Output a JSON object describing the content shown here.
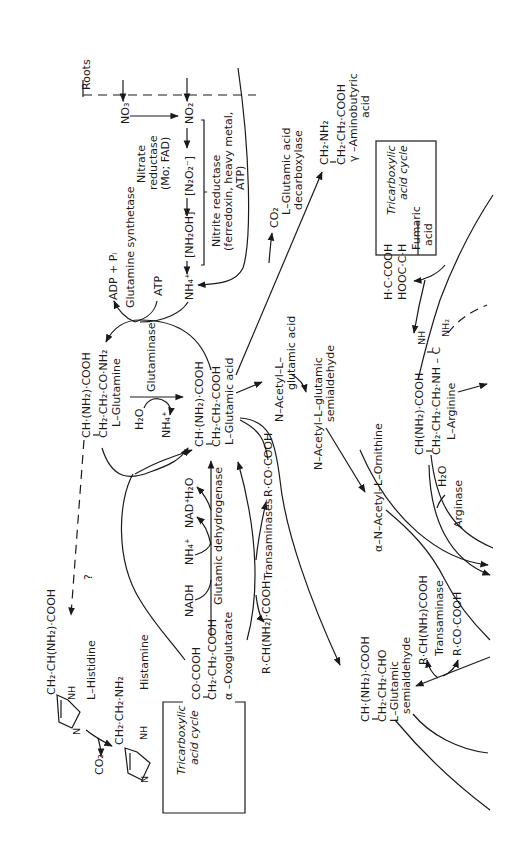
{
  "figure": {
    "orientation": "rotated 90° counter-clockwise",
    "compartment_label": "Roots",
    "nitrate_assimilation": {
      "nitrate": "NO₃⁻",
      "nitrite": "NO₂⁻",
      "nitrate_reductase": [
        "Nitrate",
        "reductase",
        "(Mo; FAD)"
      ],
      "hyponitrite": "[N₂O₂⁻]",
      "hydroxylamine": "[NH₂OH]",
      "ammonium": "NH₄⁺",
      "nitrite_reductase": [
        "Nitrite reductase",
        "(ferredoxin, heavy metal,",
        "ATP)"
      ]
    },
    "glutamine_synthetase": {
      "enzyme": "Glutamine synthetase",
      "adp_pi": "ADP + Pᵢ",
      "atp": "ATP"
    },
    "glutamine": {
      "line1": "CH·(NH₂)·COOH",
      "line2": "CH₂·CH₂·CO·NH₂",
      "name": "L–Glutamine"
    },
    "glutaminase": {
      "enzyme": "Glutaminase",
      "water": "H₂O",
      "ammonium": "NH₄⁺"
    },
    "glutamic_acid": {
      "line1": "CH·(NH₂)·COOH",
      "line2": "CH₂·CH₂·COOH",
      "name": "L–Glutamic acid"
    },
    "decarboxylation": {
      "co2": "CO₂",
      "enzyme": [
        "L–Glutamic acid",
        "decarboxylase"
      ]
    },
    "gaba": {
      "line1": "CH₂·NH₂",
      "line2": "CH₂·CH₂·COOH",
      "name": [
        "γ –Aminobutyric",
        "acid"
      ]
    },
    "tca_top": {
      "label": [
        "Tricarboxylic",
        "acid cycle"
      ],
      "fumaric_label": [
        "Fumaric",
        "acid"
      ],
      "fumarate_line1": "H·C·COOH",
      "fumarate_line2": "HOOC·C·H"
    },
    "glutamic_dehydrogenase": {
      "enzyme": "Glutamic dehydrogenase",
      "nadh": "NADH",
      "ammonium": "NH₄⁺",
      "nad": "NAD⁺",
      "water": "H₂O"
    },
    "transaminases": {
      "enzyme": "Transaminases",
      "amino_acid": "R·CH(NH₂)·COOH",
      "keto_acid": "R·CO·COOH"
    },
    "oxoglutarate": {
      "line1": "CO·COOH",
      "line2": "CH₂·CH₂·COOH",
      "name": "α –Oxoglutarate"
    },
    "tca_bottom": {
      "label": [
        "Tricarboxylic",
        "acid cycle"
      ]
    },
    "histidine": {
      "side_chain": "CH₂·CH(NH₂)·COOH",
      "nh": "NH",
      "n": "N",
      "name": "L–Histidine",
      "unknown_link": "?"
    },
    "histamine": {
      "side_chain": "CH₂·CH₂·NH₂",
      "nh": "NH",
      "n": "N",
      "name": "Histamine",
      "co2": "CO₂"
    },
    "acetyl_pathway": {
      "acetyl_glutamic": [
        "N–Acetyl–L–",
        "glutamic acid"
      ],
      "acetyl_semialdehyde": [
        "N–Acetyl–L–glutamic",
        "semialdehyde"
      ],
      "acetyl_ornithine": "α–N–Acetyl–L–Ornithine"
    },
    "arginine": {
      "line1": "CH(NH₂)·COOH",
      "line2": "CH₂·CH₂·CH₂·NH – C",
      "nh": "NH",
      "nh2": "NH₂",
      "name": "L–Arginine",
      "enzyme": "Arginase",
      "water": "H₂O"
    },
    "glutamic_semialdehyde": {
      "line1": "CH·(NH₂)·COOH",
      "line2": "CH₂·CH₂·CHO",
      "name": [
        "L–Glutamic",
        "semialdehyde"
      ],
      "enzyme": "Transaminase",
      "amino_acid": "R·CH(NH₂)COOH",
      "keto_acid": "R·CO·COOH"
    }
  }
}
